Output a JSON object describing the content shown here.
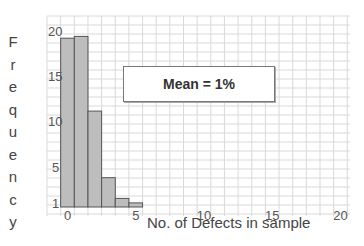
{
  "chart_data": {
    "type": "bar",
    "title": "",
    "xlabel": "No. of Defects in sample",
    "ylabel": "Frequency",
    "categories": [
      0,
      1,
      2,
      3,
      4,
      5
    ],
    "values": [
      19.2,
      19.4,
      11.1,
      3.7,
      1.4,
      0.9
    ],
    "xlim": [
      -0.5,
      20.5
    ],
    "ylim": [
      0,
      21
    ],
    "x_ticks": [
      "0",
      "5",
      "10",
      "15",
      "20"
    ],
    "y_ticks": [
      "1",
      "5",
      "10",
      "15",
      "20"
    ],
    "grid": true,
    "annotation": "Mean = 1%",
    "bar_color": "#bdbdbd",
    "bar_edge_color": "#555555",
    "grid_color": "#d9d9d9"
  },
  "ylabel_letters": [
    "F",
    "r",
    "e",
    "q",
    "u",
    "e",
    "n",
    "c",
    "y"
  ],
  "annotation_text": "Mean = 1%",
  "xlabel_text": "No. of Defects in sample"
}
